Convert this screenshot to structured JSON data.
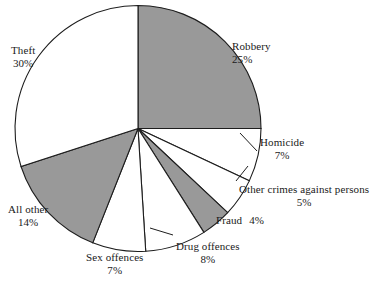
{
  "chart_data": {
    "type": "pie",
    "title": "",
    "subtitle": "",
    "xlabel": "",
    "ylabel": "",
    "legend_position": "none",
    "grid": false,
    "units": "percent",
    "start_angle_deg": 0,
    "direction": "clockwise",
    "categories": [
      "Robbery",
      "Homicide",
      "Other crimes against persons",
      "Fraud",
      "Drug offences",
      "Sex offences",
      "All other",
      "Theft"
    ],
    "values": [
      25,
      7,
      5,
      4,
      8,
      7,
      14,
      30
    ],
    "slices": [
      {
        "label": "Robbery",
        "percent_text": "25%",
        "value": 25,
        "fill": "#999999",
        "label_x": 232,
        "label_y": 40,
        "label_style": "stacked",
        "align": "left"
      },
      {
        "label": "Homicide",
        "percent_text": "7%",
        "value": 7,
        "fill": "#ffffff",
        "label_x": 260,
        "label_y": 136,
        "label_style": "center-pct",
        "align": "left"
      },
      {
        "label": "Other crimes against persons",
        "percent_text": "5%",
        "value": 5,
        "fill": "#ffffff",
        "label_x": 239,
        "label_y": 183,
        "label_style": "center-pct",
        "align": "left"
      },
      {
        "label": "Fraud",
        "percent_text": "4%",
        "value": 4,
        "fill": "#999999",
        "label_x": 216,
        "label_y": 214,
        "label_style": "inline-pct",
        "align": "left"
      },
      {
        "label": "Drug offences",
        "percent_text": "8%",
        "value": 8,
        "fill": "#ffffff",
        "label_x": 176,
        "label_y": 240,
        "label_style": "center-pct",
        "align": "left"
      },
      {
        "label": "Sex offences",
        "percent_text": "7%",
        "value": 7,
        "fill": "#ffffff",
        "label_x": 86,
        "label_y": 251,
        "label_style": "center-pct",
        "align": "left"
      },
      {
        "label": "All other",
        "percent_text": "14%",
        "value": 14,
        "fill": "#999999",
        "label_x": 8,
        "label_y": 203,
        "label_style": "center-pct",
        "align": "left"
      },
      {
        "label": "Theft",
        "percent_text": "30%",
        "value": 30,
        "fill": "#ffffff",
        "label_x": 11,
        "label_y": 44,
        "label_style": "center-pct",
        "align": "left"
      }
    ],
    "geometry": {
      "center_x": 138,
      "center_y": 128.5,
      "radius": 123
    },
    "colors": {
      "shaded": "#999999",
      "unshaded": "#ffffff",
      "outline": "#1d1d1d",
      "text": "#1a1a1a",
      "background": "#ffffff"
    },
    "leader_lines": [
      {
        "name": "homicide-leader",
        "x1": 257.0,
        "y1": 151.0,
        "x2": 240.0,
        "y2": 133.0
      },
      {
        "name": "other-crimes-leader",
        "x1": 236.0,
        "y1": 181.0,
        "x2": 248.0,
        "y2": 166.0
      },
      {
        "name": "drug-offences-leader",
        "x1": 173.0,
        "y1": 235.0,
        "x2": 150.0,
        "y2": 228.0
      }
    ]
  }
}
